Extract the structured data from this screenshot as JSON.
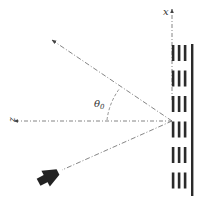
{
  "diagram": {
    "axis_x_label": "x",
    "axis_z_label": "z",
    "angle_label": "θ",
    "angle_subscript": "0",
    "colors": {
      "line": "#555555",
      "bar": "#2a2a2a",
      "horn": "#222222"
    },
    "elements": {
      "reflector": "metasurface-array",
      "source": "horn-antenna",
      "rays": [
        "incident-ray",
        "reflected-ray"
      ]
    },
    "array": {
      "columns_dashed": 3,
      "segments_per_column": 6,
      "backplane": true
    }
  }
}
